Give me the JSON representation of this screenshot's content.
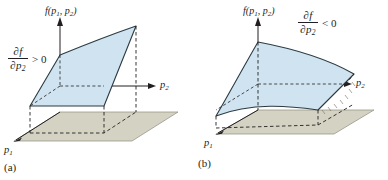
{
  "figure": {
    "background_color": "#ffffff",
    "surface_fill": "#cfe4f0",
    "surface_stroke": "#2b3a42",
    "base_plane_fill": "#d4d3c3",
    "base_plane_stroke": "#6f6e62",
    "axis_color": "#231f20",
    "dashed_color": "#231f20"
  },
  "panels": [
    {
      "id": "a",
      "caption": "(a)",
      "vertical_axis_label": {
        "fn": "f",
        "open": "(",
        "var1": "p",
        "var1_sub": "1",
        "comma": ", ",
        "var2": "p",
        "var2_sub": "2",
        "close": ")",
        "text": "f(p1, p2)"
      },
      "horizontal_axis_label": {
        "var": "p",
        "sub": "2",
        "text": "p2"
      },
      "depth_axis_label": {
        "var": "p",
        "sub": "1",
        "text": "p1"
      },
      "derivative": {
        "numerator": "∂f",
        "denominator_var": "∂p",
        "denominator_sub": "2",
        "relation": "> 0",
        "text": "∂f/∂p2 > 0"
      },
      "surface_description": "increasing in p2"
    },
    {
      "id": "b",
      "caption": "(b)",
      "vertical_axis_label": {
        "fn": "f",
        "open": "(",
        "var1": "p",
        "var1_sub": "1",
        "comma": ", ",
        "var2": "p",
        "var2_sub": "2",
        "close": ")",
        "text": "f(p1, p2)"
      },
      "horizontal_axis_label": {
        "var": "p",
        "sub": "2",
        "text": "p2"
      },
      "depth_axis_label": {
        "var": "p",
        "sub": "1",
        "text": "p1"
      },
      "derivative": {
        "numerator": "∂f",
        "denominator_var": "∂p",
        "denominator_sub": "2",
        "relation": "< 0",
        "text": "∂f/∂p2 < 0"
      },
      "surface_description": "decreasing in p2"
    }
  ]
}
